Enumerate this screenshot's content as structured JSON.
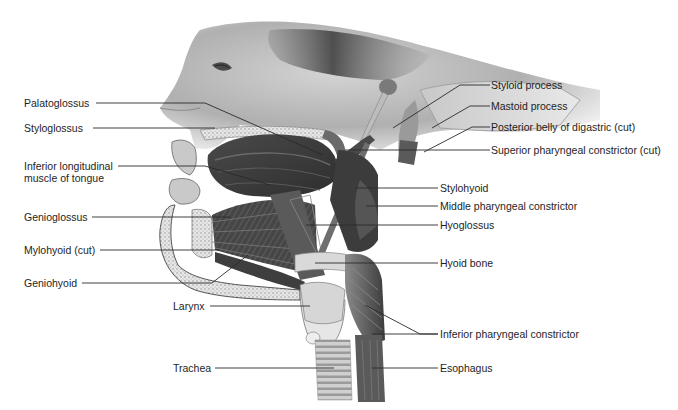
{
  "figure": {
    "title_fragment": "",
    "colors": {
      "background": "#ffffff",
      "label_text": "#1e1e1e",
      "leader_line": "#2a2a2a",
      "muscle_dark": "#3c3c3c",
      "muscle_mid": "#6e6e6e",
      "skin": "#bdbdbd",
      "bone_light": "#e2e2e2"
    }
  },
  "labels_left": [
    {
      "id": "palatoglossus",
      "text": "Palatoglossus"
    },
    {
      "id": "styloglossus",
      "text": "Styloglossus"
    },
    {
      "id": "inferior-longitudinal",
      "text": "Inferior longitudinal muscle of tongue"
    },
    {
      "id": "genioglossus",
      "text": "Genioglossus"
    },
    {
      "id": "mylohyoid",
      "text": "Mylohyoid (cut)"
    },
    {
      "id": "geniohyoid",
      "text": "Geniohyoid"
    },
    {
      "id": "larynx",
      "text": "Larynx"
    },
    {
      "id": "trachea",
      "text": "Trachea"
    }
  ],
  "labels_right": [
    {
      "id": "styloid-process",
      "text": "Styloid process"
    },
    {
      "id": "mastoid-process",
      "text": "Mastoid process"
    },
    {
      "id": "posterior-belly-digastric",
      "text": "Posterior belly of digastric (cut)"
    },
    {
      "id": "superior-pharyngeal-constrictor",
      "text": "Superior pharyngeal constrictor (cut)"
    },
    {
      "id": "stylohyoid",
      "text": "Stylohyoid"
    },
    {
      "id": "middle-pharyngeal-constrictor",
      "text": "Middle pharyngeal constrictor"
    },
    {
      "id": "hyoglossus",
      "text": "Hyoglossus"
    },
    {
      "id": "hyoid-bone",
      "text": "Hyoid bone"
    },
    {
      "id": "inferior-pharyngeal-constrictor",
      "text": "Inferior pharyngeal constrictor"
    },
    {
      "id": "esophagus",
      "text": "Esophagus"
    }
  ]
}
